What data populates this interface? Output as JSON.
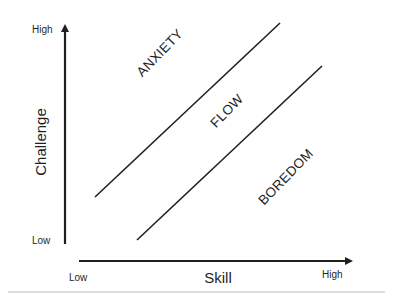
{
  "diagram": {
    "type": "flow-channel",
    "y_axis": {
      "title": "Challenge",
      "high_label": "High",
      "low_label": "Low"
    },
    "x_axis": {
      "title": "Skill",
      "low_label": "Low",
      "high_label": "High"
    },
    "zones": {
      "upper": "ANXIETY",
      "middle": "FLOW",
      "lower": "BOREDOM"
    },
    "colors": {
      "line": "#1f1f1f",
      "divider": "#bdbdbd",
      "background": "#ffffff"
    }
  }
}
